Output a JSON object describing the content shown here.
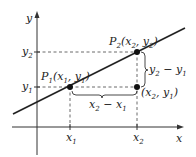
{
  "diagram": {
    "type": "slope-of-line",
    "axes": {
      "x_label": "x",
      "y_label": "y"
    },
    "points": {
      "p1": {
        "name": "P",
        "sub": "1",
        "coords": "(x",
        "coords_sub1": "1",
        "mid": ", y",
        "coords_sub2": "1",
        "close": ")"
      },
      "p2": {
        "name": "P",
        "sub": "2",
        "coords": "(x",
        "coords_sub1": "2",
        "mid": ", y",
        "coords_sub2": "2",
        "close": ")"
      },
      "corner": {
        "coords": "(x",
        "coords_sub1": "2",
        "mid": ", y",
        "coords_sub2": "1",
        "close": ")"
      }
    },
    "ticks": {
      "x1": {
        "base": "x",
        "sub": "1"
      },
      "x2": {
        "base": "x",
        "sub": "2"
      },
      "y1": {
        "base": "y",
        "sub": "1"
      },
      "y2": {
        "base": "y",
        "sub": "2"
      }
    },
    "braces": {
      "rise": {
        "a": "y",
        "a_sub": "2",
        "op": " − ",
        "b": "y",
        "b_sub": "1"
      },
      "run": {
        "a": "x",
        "a_sub": "2",
        "op": " − ",
        "b": "x",
        "b_sub": "1"
      }
    },
    "colors": {
      "line": "#222222",
      "dash": "#444444",
      "point": "#111111"
    }
  }
}
